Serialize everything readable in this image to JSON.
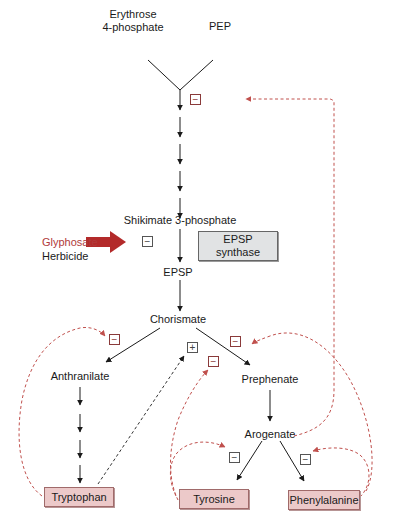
{
  "diagram": {
    "nodes": {
      "e4p": "Erythrose\n4-phosphate",
      "pep": "PEP",
      "shikimate3p": "Shikimate 3-phosphate",
      "epsp": "EPSP",
      "chorismate": "Chorismate",
      "anthranilate": "Anthranilate",
      "prephenate": "Prephenate",
      "arogenate": "Arogenate",
      "tryptophan": "Tryptophan",
      "tyrosine": "Tyrosine",
      "phenylalanine": "Phenylalanine"
    },
    "enzyme": {
      "label": "EPSP\nsynthase"
    },
    "inhibitor": {
      "name": "Glyphosate",
      "type": "Herbicide"
    },
    "signs": {
      "minus": "−",
      "plus": "+"
    },
    "colors": {
      "inhibitor_arrow": "#b32a2a",
      "feedback_line": "#c0504d",
      "product_box": "#ecc9c9",
      "enzyme_box": "#e1e3e4",
      "inhibitor_text": "#b03a3a"
    },
    "feedback": [
      {
        "from": "Phenylalanine/Arogenate",
        "to": "DAHP synthase (first step)",
        "effect": "−"
      },
      {
        "from": "Tryptophan",
        "to": "Chorismate → Anthranilate",
        "effect": "−"
      },
      {
        "from": "Tryptophan",
        "to": "Chorismate → Prephenate",
        "effect": "+"
      },
      {
        "from": "Tyrosine",
        "to": "Chorismate → Prephenate",
        "effect": "−"
      },
      {
        "from": "Phenylalanine",
        "to": "Chorismate → Prephenate",
        "effect": "−"
      },
      {
        "from": "Tyrosine",
        "to": "Arogenate → Tyrosine",
        "effect": "−"
      },
      {
        "from": "Phenylalanine",
        "to": "Arogenate → Phenylalanine",
        "effect": "−"
      },
      {
        "from": "Glyphosate",
        "to": "EPSP synthase",
        "effect": "−"
      }
    ]
  }
}
